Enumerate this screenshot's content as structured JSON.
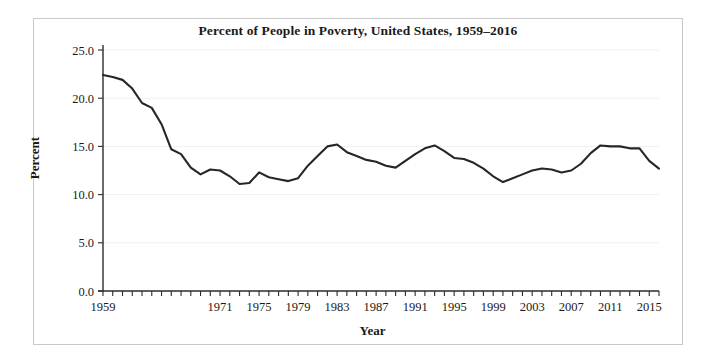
{
  "chart_data": {
    "type": "line",
    "title": "Percent of People in Poverty, United States, 1959–2016",
    "xlabel": "Year",
    "ylabel": "Percent",
    "grid": true,
    "legend": "none",
    "xlim": [
      1959,
      2016
    ],
    "ylim": [
      0.0,
      25.0
    ],
    "yticks": [
      0.0,
      5.0,
      10.0,
      15.0,
      20.0,
      25.0
    ],
    "ytick_labels": [
      "0.0",
      "5.0",
      "10.0",
      "15.0",
      "20.0",
      "25.0"
    ],
    "xticks": [
      1959,
      1971,
      1975,
      1979,
      1983,
      1987,
      1991,
      1995,
      1999,
      2003,
      2007,
      2011,
      2015
    ],
    "xtick_labels": [
      "1959",
      "1971",
      "1975",
      "1979",
      "1983",
      "1987",
      "1991",
      "1995",
      "1999",
      "2003",
      "2007",
      "2011",
      "2015"
    ],
    "x": [
      1959,
      1960,
      1961,
      1962,
      1963,
      1964,
      1965,
      1966,
      1967,
      1968,
      1969,
      1970,
      1971,
      1972,
      1973,
      1974,
      1975,
      1976,
      1977,
      1978,
      1979,
      1980,
      1981,
      1982,
      1983,
      1984,
      1985,
      1986,
      1987,
      1988,
      1989,
      1990,
      1991,
      1992,
      1993,
      1994,
      1995,
      1996,
      1997,
      1998,
      1999,
      2000,
      2001,
      2002,
      2003,
      2004,
      2005,
      2006,
      2007,
      2008,
      2009,
      2010,
      2011,
      2012,
      2013,
      2014,
      2015,
      2016
    ],
    "series": [
      {
        "name": "Percent of people in poverty",
        "color": "#262626",
        "values": [
          22.4,
          22.2,
          21.9,
          21.0,
          19.5,
          19.0,
          17.3,
          14.7,
          14.2,
          12.8,
          12.1,
          12.6,
          12.5,
          11.9,
          11.1,
          11.2,
          12.3,
          11.8,
          11.6,
          11.4,
          11.7,
          13.0,
          14.0,
          15.0,
          15.2,
          14.4,
          14.0,
          13.6,
          13.4,
          13.0,
          12.8,
          13.5,
          14.2,
          14.8,
          15.1,
          14.5,
          13.8,
          13.7,
          13.3,
          12.7,
          11.9,
          11.3,
          11.7,
          12.1,
          12.5,
          12.7,
          12.6,
          12.3,
          12.5,
          13.2,
          14.3,
          15.1,
          15.0,
          15.0,
          14.8,
          14.8,
          13.5,
          12.7
        ]
      }
    ]
  }
}
